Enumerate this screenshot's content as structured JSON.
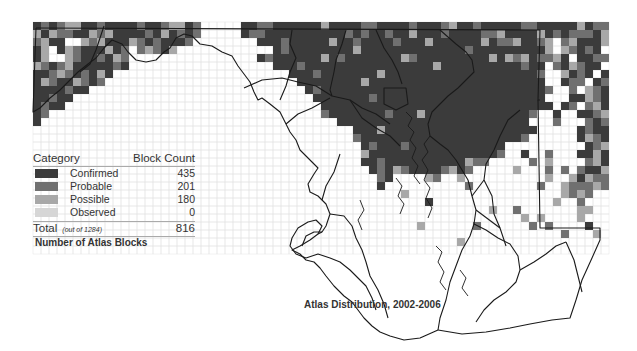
{
  "map": {
    "title": "Atlas Distribution, 2002-2006",
    "cell_size": 8,
    "origin": [
      33,
      22
    ],
    "colors": {
      "confirmed": "#3b3b3b",
      "probable": "#707070",
      "possible": "#a8a8a8",
      "observed": "#d6d6d6",
      "empty_grid": "#e4e4e4",
      "outline": "#1a1a1a"
    },
    "grid_rows": [
      "ababccaabaaaabaabccab.....aabbaaaaaacaaaabbaaaabaaabcaabaaaaabbaaaaacabbaaaaa",
      "cacbbaacbcaaaabacabab.....abbaaaaaaaaaababaabaacaaabaaaabbcaaaacababbbacaab",
      "bcaa..cbcaaacbabaaab........aaabaaaaacaabaaaabaaacaaaaaacabbcaabc.bcaaacac",
      "ac.acbaaacab.bcbac............abaaaaaaaacaaaaaaaaaaaaabaaaaaaaaac.cbaba.cb",
      "ac..cbaabacb................abaaaaaacabaaaaaaacbaaaaaaaaacacbcabbca.aabbc",
      "cbabcaaaaaba..................aaabaaaaaaaaaaaaaaaacaaaaaaaaaabaa.bacbaa.a",
      "aabcbabaca......................aaabaaaaaaacaaaaaaaaaaaaaaaaaaab..caba.ab",
      "acbaacbab........................aaaaaaaacaaaaaaaaaaaaaaaaaaaaaa..abb.abc",
      "aaaabaa...........................abaaaaaaaaaaaaaaaaaaaaaaaaaaaab..b.cbab",
      "aabaa..............................aaaaaaabaaaaaaaaaaaaaaaaaaaaa...aacbaa",
      "abaa................................aaaaaaaaaaaaaaaaaaaaaaaaaaaaa.ab.bcab",
      "ab..................................baaaaaaabaaacaaaaaaaaaaaaab..a..aabcb",
      "a.....................................aaaaaaaaaaaaaaaaaaaaaaaa...b...baba",
      "........................................aaacaaaaaaaaaaaaaaaaaaa.....abaab",
      "........................................baaaaaaaaaaaaaaaaaaaab......acbaa",
      ".........................................abaaabaaaaaaaaaaaa..........abca",
      ".........................................caaaaaaaaaaaaaaaab..a..b...aacab",
      ".........................................aabaaaaaaaaaacbb.....b.c....bcab",
      "..........................................abacbaaaabcab.....c...b.b.baac",
      "...........................................ba....cb..c..........c..cacbbc",
      "...........................................a..........b........b..cbbbcb",
      "..............................................c...................cbcb..",
      ".................................................a...............c..b...",
      ".........................................................c..b.......cc..",
      ".............................................................c.c....c...",
      "................................................c......b......b.b....a..b",
      "..................................................................b...c.",
      ".....................................................c.........................",
      "............................................................................."
    ]
  },
  "legend": {
    "header": {
      "category": "Category",
      "count": "Block Count"
    },
    "items": [
      {
        "label": "Confirmed",
        "count": "435",
        "color": "#3b3b3b"
      },
      {
        "label": "Probable",
        "count": "201",
        "color": "#707070"
      },
      {
        "label": "Possible",
        "count": "180",
        "color": "#a8a8a8"
      },
      {
        "label": "Observed",
        "count": "0",
        "color": "#d6d6d6"
      }
    ],
    "total": {
      "label": "Total",
      "note": "(out of 1284)",
      "count": "816"
    },
    "title": "Number of Atlas Blocks"
  }
}
